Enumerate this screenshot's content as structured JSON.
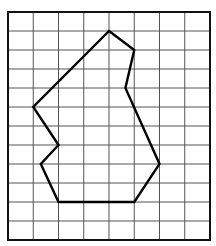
{
  "grid": {
    "columns": 8,
    "rows": 12,
    "origin": [
      8,
      12
    ],
    "cell_width": 25.25,
    "cell_height": 19,
    "line_color": "#555555",
    "border_color": "#111111"
  },
  "shape": {
    "name": "irregular-polygon",
    "stroke": "#000000",
    "vertices_grid": [
      [
        4,
        1
      ],
      [
        5,
        2
      ],
      [
        4.65,
        4
      ],
      [
        6,
        8
      ],
      [
        5,
        10
      ],
      [
        2,
        10
      ],
      [
        1.3,
        8
      ],
      [
        2,
        7
      ],
      [
        1,
        5
      ]
    ]
  }
}
